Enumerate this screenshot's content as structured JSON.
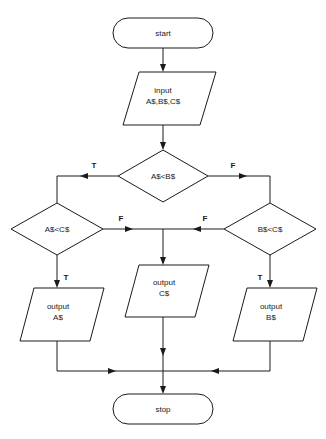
{
  "diagram": {
    "type": "flowchart",
    "colors": {
      "background": "#ffffff",
      "stroke": "#1a1a1a",
      "fill": "#ffffff",
      "text": "#1a1a1a"
    }
  },
  "nodes": {
    "start": {
      "label": "start",
      "shape": "terminator"
    },
    "input": {
      "line1": "input",
      "line2": "A$,B$,C$",
      "shape": "parallelogram"
    },
    "decision_ab": {
      "label": "A$<B$",
      "shape": "diamond"
    },
    "decision_ac": {
      "label": "A$<C$",
      "shape": "diamond"
    },
    "decision_bc": {
      "label": "B$<C$",
      "shape": "diamond"
    },
    "output_a": {
      "line1": "output",
      "line2": "A$",
      "shape": "parallelogram"
    },
    "output_c": {
      "line1": "output",
      "line2": "C$",
      "shape": "parallelogram"
    },
    "output_b": {
      "line1": "output",
      "line2": "B$",
      "shape": "parallelogram"
    },
    "stop": {
      "label": "stop",
      "shape": "terminator"
    }
  },
  "edge_labels": {
    "ab_true": "T",
    "ab_false": "F",
    "ac_true": "T",
    "ac_false": "F",
    "bc_true": "T",
    "bc_false": "F"
  }
}
